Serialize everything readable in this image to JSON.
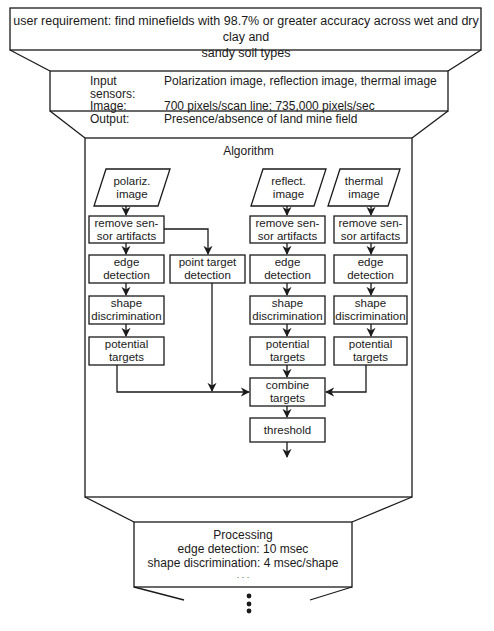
{
  "requirement": {
    "line1": "user requirement: find minefields with 98.7% or greater accuracy across wet and dry clay and",
    "line2": "sandy soil types"
  },
  "spec": {
    "rows": [
      {
        "key": "Input sensors:",
        "value": "Polarization image, reflection image, thermal image"
      },
      {
        "key": "Image:",
        "value": "700 pixels/scan line; 735,000 pixels/sec"
      },
      {
        "key": "Output:",
        "value": "Presence/absence of land mine field"
      }
    ]
  },
  "algorithm": {
    "title": "Algorithm",
    "inputs": {
      "polariz": {
        "line1": "polariz.",
        "line2": "image"
      },
      "reflect": {
        "line1": "reflect.",
        "line2": "image"
      },
      "thermal": {
        "line1": "thermal",
        "line2": "image"
      }
    },
    "steps": {
      "remove_artifacts": {
        "line1": "remove sen-",
        "line2": "sor artifacts"
      },
      "edge_detection": {
        "line1": "edge",
        "line2": "detection"
      },
      "shape_discrimination": {
        "line1": "shape",
        "line2": "discrimination"
      },
      "potential_targets": {
        "line1": "potential",
        "line2": "targets"
      },
      "point_target_detection": {
        "line1": "point target",
        "line2": "detection"
      },
      "combine_targets": {
        "line1": "combine",
        "line2": "targets"
      },
      "threshold": {
        "line1": "threshold"
      }
    }
  },
  "processing": {
    "title": "Processing",
    "lines": [
      "edge detection: 10 msec",
      "shape discrimination: 4 msec/shape",
      ". . ."
    ]
  },
  "colors": {
    "stroke": "#1a1a1a",
    "background": "#ffffff"
  }
}
